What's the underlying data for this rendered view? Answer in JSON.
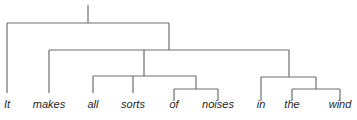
{
  "diagram": {
    "type": "constituency-tree",
    "line_color": "#6e6e6e",
    "text_color": "#1e1e1e",
    "words": [
      {
        "text": "It",
        "x": 7
      },
      {
        "text": "makes",
        "x": 49
      },
      {
        "text": "all",
        "x": 93
      },
      {
        "text": "sorts",
        "x": 133
      },
      {
        "text": "of",
        "x": 174
      },
      {
        "text": "noises",
        "x": 218
      },
      {
        "text": "in",
        "x": 261
      },
      {
        "text": "the",
        "x": 292
      },
      {
        "text": "wind",
        "x": 340
      }
    ],
    "edges": [
      {
        "x1": 88,
        "y1": 5,
        "x2": 88,
        "y2": 23
      },
      {
        "x1": 7,
        "y1": 23,
        "x2": 169,
        "y2": 23
      },
      {
        "x1": 7,
        "y1": 23,
        "x2": 7,
        "y2": 93
      },
      {
        "x1": 169,
        "y1": 23,
        "x2": 169,
        "y2": 50
      },
      {
        "x1": 49,
        "y1": 50,
        "x2": 289,
        "y2": 50
      },
      {
        "x1": 49,
        "y1": 50,
        "x2": 49,
        "y2": 93
      },
      {
        "x1": 144,
        "y1": 50,
        "x2": 144,
        "y2": 76
      },
      {
        "x1": 93,
        "y1": 76,
        "x2": 196,
        "y2": 76
      },
      {
        "x1": 93,
        "y1": 76,
        "x2": 93,
        "y2": 93
      },
      {
        "x1": 133,
        "y1": 76,
        "x2": 133,
        "y2": 93
      },
      {
        "x1": 196,
        "y1": 76,
        "x2": 196,
        "y2": 89
      },
      {
        "x1": 174,
        "y1": 89,
        "x2": 218,
        "y2": 89
      },
      {
        "x1": 174,
        "y1": 89,
        "x2": 174,
        "y2": 101
      },
      {
        "x1": 218,
        "y1": 89,
        "x2": 218,
        "y2": 101
      },
      {
        "x1": 289,
        "y1": 50,
        "x2": 289,
        "y2": 77
      },
      {
        "x1": 261,
        "y1": 77,
        "x2": 316,
        "y2": 77
      },
      {
        "x1": 261,
        "y1": 77,
        "x2": 261,
        "y2": 101
      },
      {
        "x1": 316,
        "y1": 77,
        "x2": 316,
        "y2": 89
      },
      {
        "x1": 292,
        "y1": 89,
        "x2": 340,
        "y2": 89
      },
      {
        "x1": 292,
        "y1": 89,
        "x2": 292,
        "y2": 101
      },
      {
        "x1": 340,
        "y1": 89,
        "x2": 340,
        "y2": 101
      }
    ]
  }
}
